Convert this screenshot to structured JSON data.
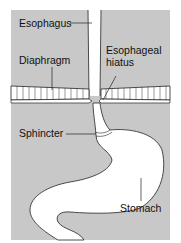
{
  "figure": {
    "background_color": "#c8c8c8",
    "organ_fill": "#ffffff",
    "outline_color": "#222222"
  },
  "labels": {
    "esophagus": "Esophagus",
    "diaphragm": "Diaphragm",
    "esophageal_hiatus_line1": "Esophageal",
    "esophageal_hiatus_line2": "hiatus",
    "sphincter": "Sphincter",
    "stomach": "Stomach"
  }
}
